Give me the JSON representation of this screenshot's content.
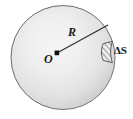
{
  "figure": {
    "type": "physics-diagram",
    "background_color": "#ffffff",
    "sphere": {
      "name": "sphere",
      "center": {
        "x": 57,
        "y": 53
      },
      "radius": 52,
      "outline_color": "#4a4a4a",
      "fill_light": "#f2f2f2",
      "fill_mid": "#dcdcdc",
      "fill_dark": "#b9b9b9"
    },
    "center_point": {
      "name": "center-dot",
      "x": 57,
      "y": 53,
      "color": "#111111"
    },
    "radius_line": {
      "name": "radius-line",
      "from": {
        "x": 57,
        "y": 53
      },
      "to": {
        "x": 108,
        "y": 25
      },
      "color": "#2a2a2a"
    },
    "surface_element": {
      "name": "surface-element-patch",
      "x": 102,
      "y": 41,
      "width": 12,
      "height": 21,
      "hatch_color": "#555555",
      "fill_color": "#ededed"
    },
    "labels": {
      "radius": "R",
      "center": "O",
      "surface_element": "ΔS"
    }
  }
}
